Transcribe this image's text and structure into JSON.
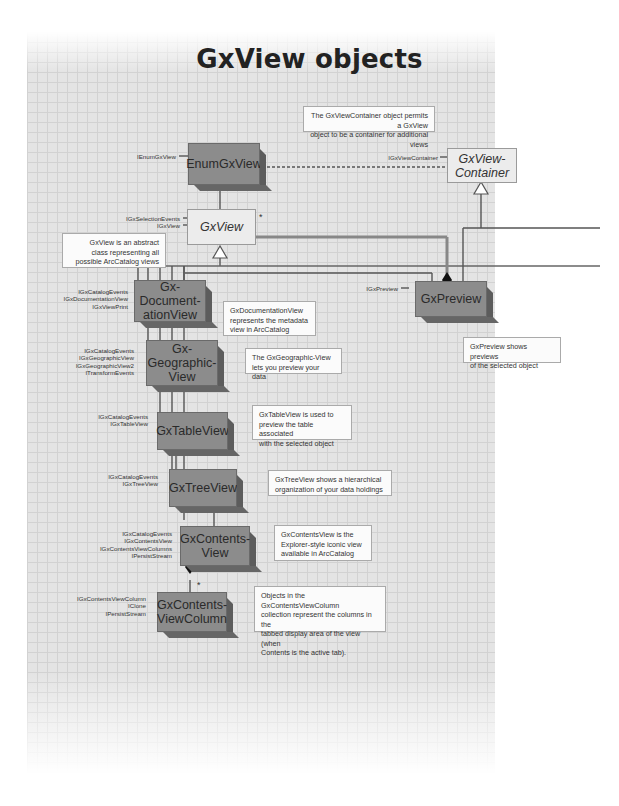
{
  "title": "GxView objects",
  "colors": {
    "concrete_class": "#8c8c8c",
    "abstract_class": "#ececec",
    "grid_bg": "#e4e4e4",
    "note_bg": "#fbfbfb",
    "line": "#555555"
  },
  "classes": {
    "enum_gx_view": {
      "name": "EnumGxView",
      "kind": "concrete",
      "interfaces": [
        "IEnumGxView"
      ]
    },
    "gx_view": {
      "name": "GxView",
      "kind": "abstract",
      "interfaces": [
        "IGxSelectionEvents",
        "IGxView"
      ]
    },
    "gx_view_container": {
      "name": "GxView-Container",
      "kind": "abstract",
      "interfaces": [
        "IGxViewContainer"
      ]
    },
    "gx_preview": {
      "name": "GxPreview",
      "kind": "concrete",
      "interfaces": [
        "IGxPreview"
      ]
    },
    "gx_documentation_view": {
      "name": "Gx-Documentation-View",
      "kind": "concrete",
      "interfaces": [
        "IGxCatalogEvents",
        "IGxDocumentationView",
        "IGxViewPrint"
      ]
    },
    "gx_geographic_view": {
      "name": "Gx-Geographic-View",
      "kind": "concrete",
      "interfaces": [
        "IGxCatalogEvents",
        "IGxGeographicView",
        "IGxGeographicView2",
        "ITransformEvents"
      ]
    },
    "gx_table_view": {
      "name": "GxTableView",
      "kind": "concrete",
      "interfaces": [
        "IGxCatalogEvents",
        "IGxTableView"
      ]
    },
    "gx_tree_view": {
      "name": "GxTreeView",
      "kind": "concrete",
      "interfaces": [
        "IGxCatalogEvents",
        "IGxTreeView"
      ]
    },
    "gx_contents_view": {
      "name": "GxContents-View",
      "kind": "concrete",
      "interfaces": [
        "IGxCatalogEvents",
        "IGxContentsView",
        "IGxContentsViewColumns",
        "IPersistStream"
      ]
    },
    "gx_contents_view_column": {
      "name": "GxContents-ViewColumn",
      "kind": "concrete",
      "interfaces": [
        "IGxContentsViewColumn",
        "IClone",
        "IPersistStream"
      ]
    }
  },
  "labels": {
    "enum": "EnumGxView",
    "view": "GxView",
    "container_l1": "GxView-",
    "container_l2": "Container",
    "preview": "GxPreview",
    "doc_l1": "Gx-",
    "doc_l2": "Document-",
    "doc_l3": "ationView",
    "geo_l1": "Gx-",
    "geo_l2": "Geographic-",
    "geo_l3": "View",
    "table": "GxTableView",
    "tree": "GxTreeView",
    "contents_l1": "GxContents-",
    "contents_l2": "View",
    "column_l1": "GxContents-",
    "column_l2": "ViewColumn"
  },
  "multiplicity": {
    "view_star": "*",
    "column_star": "*"
  },
  "notes": {
    "container": [
      "The GxViewContainer object permits a GxView",
      "object to be a container for additional views"
    ],
    "view": [
      "GxView is an abstract",
      "class representing all",
      "possible ArcCatalog views"
    ],
    "documentation": [
      "GxDocumentationView",
      "represents the metadata",
      "view in ArcCatalog"
    ],
    "geographic": [
      "The GxGeographic-View",
      "lets you preview your data"
    ],
    "table": [
      "GxTableView is used to",
      "preview the table associated",
      "with the selected object"
    ],
    "tree": [
      "GxTreeView shows a hierarchical",
      "organization of your data holdings"
    ],
    "contents": [
      "GxContentsView is the",
      "Explorer-style iconic view",
      "available in ArcCatalog"
    ],
    "column": [
      "Objects in the GxContentsViewColumn",
      "collection represent the columns in the",
      "tabbed display area of the view (when",
      "Contents is the active tab)."
    ],
    "preview": [
      "GxPreview shows previews",
      "of the selected object"
    ]
  }
}
